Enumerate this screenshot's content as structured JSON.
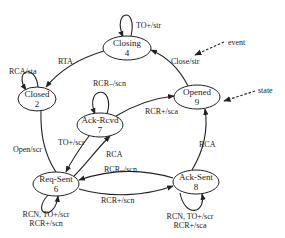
{
  "diagram": {
    "type": "state-machine",
    "states": [
      {
        "id": "closing",
        "name": "Closing",
        "number": "4"
      },
      {
        "id": "closed",
        "name": "Closed",
        "number": "2"
      },
      {
        "id": "opened",
        "name": "Opened",
        "number": "9"
      },
      {
        "id": "ack_rcvd",
        "name": "Ack-Rcvd",
        "number": "7"
      },
      {
        "id": "req_sent",
        "name": "Req-Sent",
        "number": "6"
      },
      {
        "id": "ack_sent",
        "name": "Ack-Sent",
        "number": "8"
      }
    ],
    "transitions": [
      {
        "from": "closing",
        "to": "closing",
        "label": "TO+/str"
      },
      {
        "from": "closing",
        "to": "closed",
        "label": "RTA"
      },
      {
        "from": "closed",
        "to": "closed",
        "label": "RCA/sta"
      },
      {
        "from": "opened",
        "to": "closing",
        "label": "Close/str"
      },
      {
        "from": "closed",
        "to": "req_sent",
        "label": "Open/scr"
      },
      {
        "from": "ack_rcvd",
        "to": "ack_rcvd",
        "label": "RCR–/scn"
      },
      {
        "from": "ack_rcvd",
        "to": "opened",
        "label": "RCR+/sca"
      },
      {
        "from": "ack_rcvd",
        "to": "req_sent",
        "label": "TO+/scr"
      },
      {
        "from": "req_sent",
        "to": "ack_rcvd",
        "label": "RCA"
      },
      {
        "from": "ack_sent",
        "to": "req_sent",
        "label": "RCR–/scn"
      },
      {
        "from": "req_sent",
        "to": "ack_sent",
        "label": "RCR+/scn"
      },
      {
        "from": "ack_sent",
        "to": "opened",
        "label": "RCA"
      },
      {
        "from": "req_sent",
        "to": "req_sent",
        "label_lines": [
          "RCN, TO+/scr",
          "RCR+/scn"
        ]
      },
      {
        "from": "ack_sent",
        "to": "ack_sent",
        "label_lines": [
          "RCN, TO+/scr",
          "RCR+/sca"
        ]
      }
    ],
    "annotations": [
      {
        "label": "event",
        "points_to": "Close/str"
      },
      {
        "label": "state",
        "points_to": "Opened 9"
      }
    ]
  }
}
